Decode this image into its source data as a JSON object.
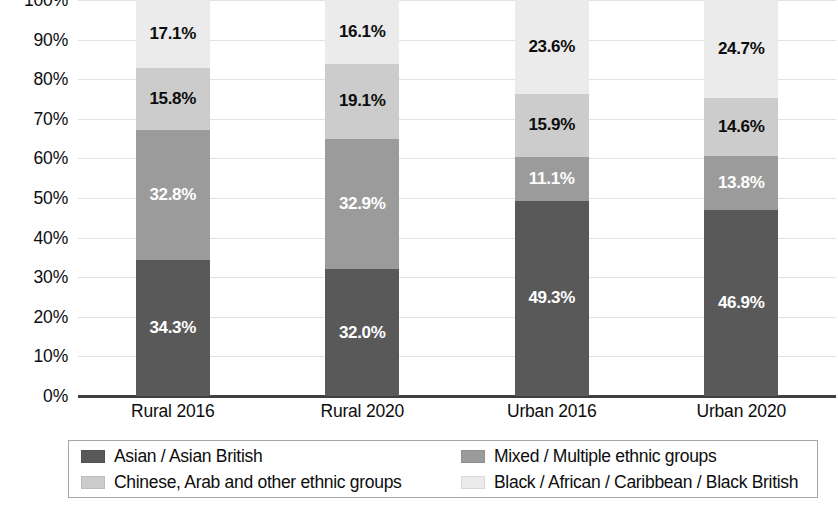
{
  "chart_data": {
    "type": "bar",
    "stacked": true,
    "stack_mode": "percent",
    "title": "",
    "subtitle": "",
    "xlabel": "",
    "ylabel": "",
    "ylim": [
      0,
      100
    ],
    "y_tick_labels": [
      "100%",
      "90%",
      "80%",
      "70%",
      "60%",
      "50%",
      "40%",
      "30%",
      "20%",
      "10%",
      "0%"
    ],
    "y_tick_values": [
      100,
      90,
      80,
      70,
      60,
      50,
      40,
      30,
      20,
      10,
      0
    ],
    "grid": true,
    "grid_axis": "y",
    "legend_position": "bottom",
    "categories": [
      "Rural 2016",
      "Rural 2020",
      "Urban 2016",
      "Urban 2020"
    ],
    "series": [
      {
        "name": "Asian / Asian British",
        "color": "#595959",
        "label_color": "#ffffff",
        "values": [
          34.3,
          32.0,
          49.3,
          46.9
        ],
        "labels": [
          "34.3%",
          "32.0%",
          "49.3%",
          "46.9%"
        ]
      },
      {
        "name": "Mixed / Multiple ethnic groups",
        "color": "#9b9b9b",
        "label_color": "#ffffff",
        "values": [
          32.8,
          32.9,
          11.1,
          13.8
        ],
        "labels": [
          "32.8%",
          "32.9%",
          "11.1%",
          "13.8%"
        ]
      },
      {
        "name": "Chinese, Arab and other ethnic groups",
        "color": "#cccccc",
        "label_color": "#0d0d0d",
        "values": [
          15.8,
          19.1,
          15.9,
          14.6
        ],
        "labels": [
          "15.8%",
          "19.1%",
          "15.9%",
          "14.6%"
        ]
      },
      {
        "name": "Black / African / Caribbean / Black British",
        "color": "#ebebeb",
        "label_color": "#0d0d0d",
        "values": [
          17.1,
          16.1,
          23.6,
          24.7
        ],
        "labels": [
          "17.1%",
          "16.1%",
          "23.6%",
          "24.7%"
        ]
      }
    ]
  },
  "legend": {
    "entries": [
      {
        "label": "Asian / Asian British",
        "color": "#595959"
      },
      {
        "label": "Mixed / Multiple ethnic groups",
        "color": "#9b9b9b"
      },
      {
        "label": "Chinese, Arab and other ethnic groups",
        "color": "#cccccc"
      },
      {
        "label": "Black / African / Caribbean / Black British",
        "color": "#ebebeb"
      }
    ]
  }
}
